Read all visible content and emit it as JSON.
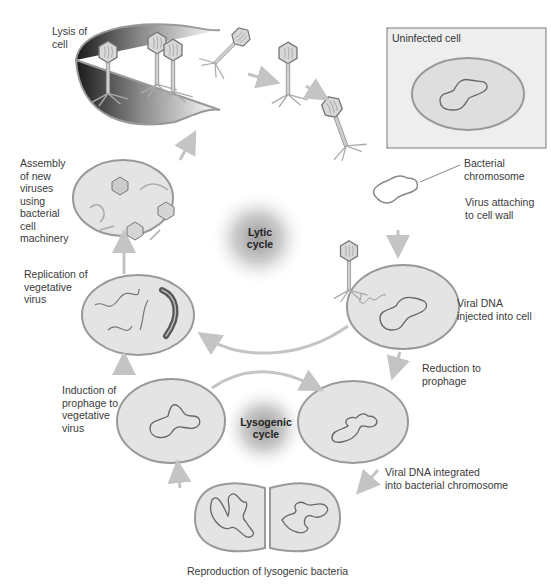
{
  "diagram": {
    "colors": {
      "cell_fill": "#e4e4e4",
      "cell_stroke": "#8a8a8a",
      "chromosome": "#6b6b6b",
      "arrow": "#c4c4c4",
      "box_fill": "#eeeeee",
      "box_stroke": "#7a7a7a",
      "viral_dna_dark": "#555555"
    },
    "cycles": {
      "lytic": "Lytic\ncycle",
      "lysogenic": "Lysogenic\ncycle"
    },
    "inset": {
      "title": "Uninfected cell"
    },
    "labels": {
      "lysis": "Lysis of\ncell",
      "assembly": "Assembly\nof new\nviruses\nusing\nbacterial\ncell\nmachinery",
      "replication": "Replication of\nvegetative\nvirus",
      "induction": "Induction of\nprophage to\nvegetative\nvirus",
      "bacterial_chromosome": "Bacterial\nchromosome",
      "virus_attaching": "Virus attaching\nto cell wall",
      "viral_dna_injected": "Viral DNA\ninjected into cell",
      "reduction": "Reduction to\nprophage",
      "viral_dna_integrated": "Viral DNA integrated\ninto bacterial chromosome",
      "reproduction": "Reproduction of lysogenic bacteria"
    }
  }
}
